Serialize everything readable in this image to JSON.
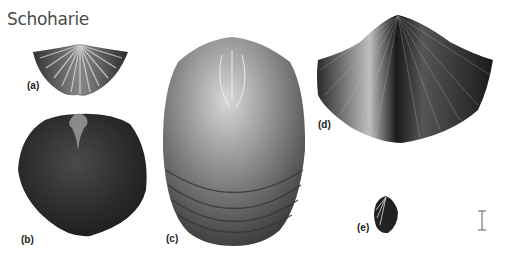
{
  "figure": {
    "title": "Schoharie",
    "specimens": [
      {
        "id": "a",
        "label": "(a)",
        "description": "small ribbed transverse brachiopod, fan-shaped"
      },
      {
        "id": "b",
        "label": "(b)",
        "description": "dark smooth rounded brachiopod with muscle scars near hinge"
      },
      {
        "id": "c",
        "label": "(c)",
        "description": "large elongate shell with concentric growth lines, interior view"
      },
      {
        "id": "d",
        "label": "(d)",
        "description": "finely ribbed pyramidal brachiopod"
      },
      {
        "id": "e",
        "label": "(e)",
        "description": "very small ribbed brachiopod"
      }
    ],
    "scale_bar": {
      "visible": true,
      "color": "#777777"
    }
  }
}
